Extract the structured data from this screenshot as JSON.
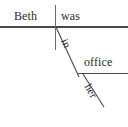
{
  "diagram": {
    "type": "reed-kellogg-sentence-diagram",
    "sentence": "Beth was in her office",
    "canvas": {
      "width": 128,
      "height": 127,
      "background": "#ffffff"
    },
    "ink_color": "#4a4a4a",
    "text_color": "#2b2b2b",
    "words": {
      "subject": "Beth",
      "verb": "was",
      "preposition": "in",
      "object_of_preposition": "office",
      "modifier": "her"
    },
    "lines": {
      "main_baseline": {
        "x1": 0,
        "y1": 27,
        "x2": 128,
        "y2": 27
      },
      "subject_verb_divider": {
        "x1": 55,
        "y1": 5,
        "x2": 55,
        "y2": 50
      },
      "preposition_slant": {
        "x1": 56,
        "y1": 27,
        "x2": 79,
        "y2": 77
      },
      "object_baseline": {
        "x1": 78,
        "y1": 73,
        "x2": 128,
        "y2": 73
      },
      "modifier_slant": {
        "x1": 83,
        "y1": 74,
        "x2": 104,
        "y2": 107
      }
    }
  }
}
